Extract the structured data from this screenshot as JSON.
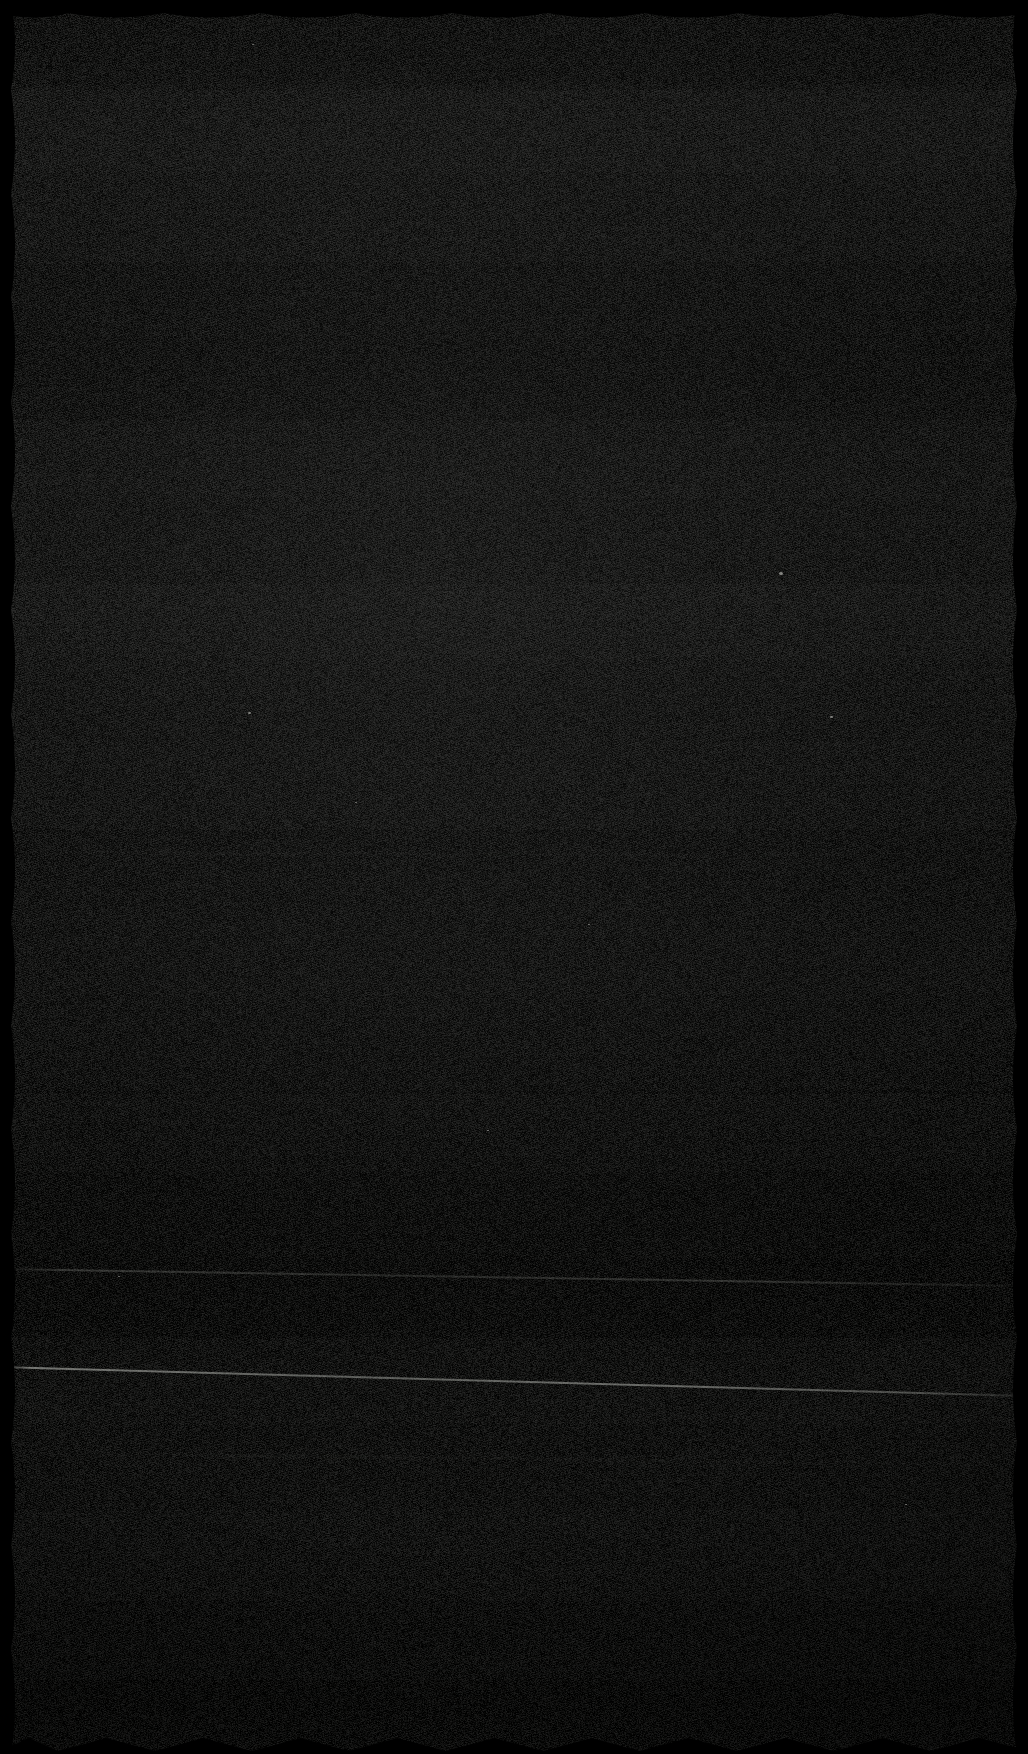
{
  "image": {
    "width": 1028,
    "height": 1754,
    "kind": "degraded-screenshot",
    "description": "Near-black, heavily degraded image consisting of fine-grained sensor/compression noise with faint horizontal banding. No legible user-interface text, icons, controls or chart content is visible.",
    "legible_text": "",
    "visible_controls": [],
    "visible_numbers": []
  },
  "appearance": {
    "overall": "near-black noise field",
    "base_color": "#171717",
    "darkest_color": "#000000",
    "lightest_color": "#2a2a28",
    "noise_grain_px": 1,
    "noise_opacity": 0.5,
    "banding": {
      "orientation": "horizontal",
      "visible": true,
      "band_boundaries_y": [
        84,
        172,
        262,
        336,
        420,
        498,
        584,
        660,
        742,
        830,
        912,
        996,
        1094,
        1172,
        1258,
        1338,
        1424,
        1510,
        1596,
        1680
      ]
    }
  },
  "edges": {
    "style": "scalloped-wavy-black-border",
    "top": {
      "shape": "scallop",
      "period_px": 96,
      "depth_px": 13
    },
    "bottom": {
      "shape": "sawtooth",
      "period_px": 97,
      "depth_px": 16
    },
    "left": {
      "shape": "scallop",
      "period_px": 104,
      "depth_px": 11
    },
    "right": {
      "shape": "scallop",
      "period_px": 104,
      "depth_px": 11
    },
    "color": "#000000"
  },
  "streaks": [
    {
      "name": "primary-bright-diagonal-streak",
      "y_start": 1366,
      "angle_deg": 1.62,
      "thickness_px": 2,
      "brightness": "high",
      "color": "#d0d2cc"
    },
    {
      "name": "secondary-diagonal-streak",
      "y_start": 1268,
      "angle_deg": 0.95,
      "thickness_px": 2,
      "brightness": "low",
      "color": "#a8aaa4"
    },
    {
      "name": "tertiary-diagonal-streak",
      "y_start": 1452,
      "angle_deg": 0.7,
      "thickness_px": 1,
      "brightness": "very-low",
      "color": "#8c8e89"
    },
    {
      "name": "upper-faint-streak",
      "y_start": 852,
      "angle_deg": 0.22,
      "thickness_px": 1,
      "brightness": "very-low",
      "color": "#7a7c78"
    }
  ],
  "specks": [
    {
      "x": 248,
      "y": 712,
      "size": 3
    },
    {
      "x": 830,
      "y": 716,
      "size": 3
    },
    {
      "x": 779,
      "y": 572,
      "size": 4
    },
    {
      "x": 1022,
      "y": 470,
      "size": 2
    },
    {
      "x": 487,
      "y": 1130,
      "size": 2
    },
    {
      "x": 355,
      "y": 802,
      "size": 2
    },
    {
      "x": 252,
      "y": 44,
      "size": 2
    },
    {
      "x": 588,
      "y": 924,
      "size": 2
    },
    {
      "x": 905,
      "y": 1504,
      "size": 2
    },
    {
      "x": 118,
      "y": 1276,
      "size": 2
    }
  ]
}
